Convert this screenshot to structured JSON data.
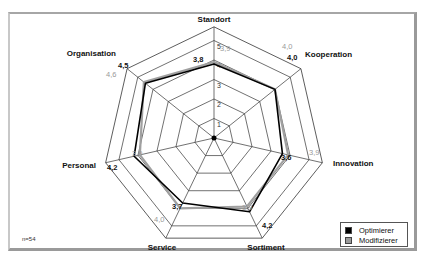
{
  "chart_data": {
    "type": "radar",
    "title": "",
    "axes": [
      "Standort",
      "Kooperation",
      "Innovation",
      "Sortiment",
      "Service",
      "Personal",
      "Organisation"
    ],
    "scale_ticks": [
      "1",
      "2",
      "3",
      "4",
      "5"
    ],
    "range": [
      0,
      5
    ],
    "series": [
      {
        "name": "Optimierer",
        "color": "#000000",
        "values": [
          3.8,
          4.0,
          3.6,
          4.2,
          3.7,
          4.2,
          4.5
        ],
        "labels": [
          "3,8",
          "4,0",
          "3,6",
          "4,2",
          "3,7",
          "4,2",
          "4,5"
        ]
      },
      {
        "name": "Modifizierer",
        "color": "#9a9a9a",
        "values": [
          3.9,
          4.0,
          3.9,
          3.9,
          4.0,
          3.9,
          4.6
        ],
        "labels": [
          "3,9",
          "4,0",
          "3,9",
          "3,9",
          "4,0",
          "3,9",
          "4,6"
        ]
      }
    ],
    "legend_position": "bottom-right",
    "annotation": "n=54"
  },
  "legend": {
    "items": [
      {
        "label": "Optimierer",
        "color": "#000000"
      },
      {
        "label": "Modifizierer",
        "color": "#9a9a9a"
      }
    ]
  },
  "note": "n=54"
}
